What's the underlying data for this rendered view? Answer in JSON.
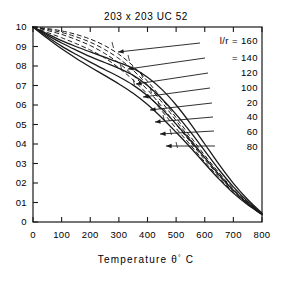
{
  "chart_data": {
    "type": "line",
    "title": "203 x 203  UC 52",
    "xlabel": "Temperature  θ° C",
    "ylabel": "",
    "xlim": [
      0,
      800
    ],
    "ylim": [
      0,
      1.0
    ],
    "grid": false,
    "legend_position": "right-inside",
    "xticks": [
      0,
      100,
      200,
      300,
      400,
      500,
      600,
      700,
      800
    ],
    "xticklabels": [
      "0",
      "100",
      "200",
      "300",
      "400",
      "500",
      "600",
      "700",
      "800"
    ],
    "yticks": [
      0,
      0.1,
      0.2,
      0.3,
      0.4,
      0.5,
      0.6,
      0.7,
      0.8,
      0.9,
      1.0
    ],
    "yticklabels": [
      "0",
      "01",
      "02",
      "03",
      "04",
      "05",
      "06",
      "07",
      "08",
      "09",
      "10"
    ],
    "legend_title": "l/r = 160",
    "legend_entries": [
      {
        "label": "l/r = 160",
        "value": 160,
        "style": "solid"
      },
      {
        "label": "= 140",
        "value": 140,
        "style": "solid"
      },
      {
        "label": "120",
        "value": 120,
        "style": "solid"
      },
      {
        "label": "100",
        "value": 100,
        "style": "solid"
      },
      {
        "label": "20",
        "value": 20,
        "style": "solid"
      },
      {
        "label": "40",
        "value": 40,
        "style": "solid"
      },
      {
        "label": "60",
        "value": 60,
        "style": "solid"
      },
      {
        "label": "80",
        "value": 80,
        "style": "solid"
      }
    ],
    "series": [
      {
        "name": "l/r = 160",
        "style": "solid",
        "x": [
          0,
          50,
          100,
          150,
          200,
          250,
          300,
          350,
          400,
          450,
          500,
          550,
          600,
          650,
          700,
          750,
          800
        ],
        "y": [
          1.0,
          0.965,
          0.93,
          0.9,
          0.872,
          0.845,
          0.818,
          0.788,
          0.742,
          0.68,
          0.6,
          0.505,
          0.4,
          0.295,
          0.198,
          0.115,
          0.045
        ]
      },
      {
        "name": "l/r = 140",
        "style": "solid",
        "x": [
          0,
          50,
          100,
          150,
          200,
          250,
          300,
          350,
          400,
          450,
          500,
          550,
          600,
          650,
          700,
          750,
          800
        ],
        "y": [
          1.0,
          0.958,
          0.918,
          0.882,
          0.848,
          0.818,
          0.788,
          0.752,
          0.7,
          0.632,
          0.552,
          0.462,
          0.365,
          0.268,
          0.18,
          0.105,
          0.042
        ]
      },
      {
        "name": "l/r = 120",
        "style": "solid",
        "x": [
          0,
          50,
          100,
          150,
          200,
          250,
          300,
          350,
          400,
          450,
          500,
          550,
          600,
          650,
          700,
          750,
          800
        ],
        "y": [
          1.0,
          0.95,
          0.902,
          0.86,
          0.82,
          0.782,
          0.745,
          0.702,
          0.648,
          0.58,
          0.502,
          0.418,
          0.33,
          0.242,
          0.162,
          0.095,
          0.04
        ]
      },
      {
        "name": "l/r = 100",
        "style": "solid",
        "x": [
          0,
          50,
          100,
          150,
          200,
          250,
          300,
          350,
          400,
          450,
          500,
          550,
          600,
          650,
          700,
          750,
          800
        ],
        "y": [
          1.0,
          0.942,
          0.888,
          0.84,
          0.795,
          0.752,
          0.708,
          0.66,
          0.602,
          0.535,
          0.46,
          0.382,
          0.3,
          0.22,
          0.148,
          0.088,
          0.038
        ]
      },
      {
        "name": "l/r = 20",
        "style": "dashed",
        "x": [
          0,
          50,
          100,
          150,
          200,
          250,
          300,
          350,
          400,
          450,
          500,
          550,
          600,
          650,
          700,
          750,
          800
        ],
        "y": [
          1.0,
          0.992,
          0.98,
          0.962,
          0.938,
          0.905,
          0.86,
          0.8,
          0.722,
          0.632,
          0.535,
          0.438,
          0.342,
          0.252,
          0.17,
          0.1,
          0.04
        ]
      },
      {
        "name": "l/r = 40",
        "style": "dashed",
        "x": [
          0,
          50,
          100,
          150,
          200,
          250,
          300,
          350,
          400,
          450,
          500,
          550,
          600,
          650,
          700,
          750,
          800
        ],
        "y": [
          1.0,
          0.988,
          0.972,
          0.95,
          0.922,
          0.885,
          0.838,
          0.778,
          0.702,
          0.615,
          0.52,
          0.425,
          0.332,
          0.245,
          0.165,
          0.097,
          0.039
        ]
      },
      {
        "name": "l/r = 60",
        "style": "dashed",
        "x": [
          0,
          50,
          100,
          150,
          200,
          250,
          300,
          350,
          400,
          450,
          500,
          550,
          600,
          650,
          700,
          750,
          800
        ],
        "y": [
          1.0,
          0.982,
          0.962,
          0.936,
          0.905,
          0.865,
          0.815,
          0.752,
          0.678,
          0.592,
          0.5,
          0.41,
          0.32,
          0.236,
          0.158,
          0.093,
          0.038
        ]
      },
      {
        "name": "l/r = 80",
        "style": "dashed",
        "x": [
          0,
          50,
          100,
          150,
          200,
          250,
          300,
          350,
          400,
          450,
          500,
          550,
          600,
          650,
          700,
          750,
          800
        ],
        "y": [
          1.0,
          0.972,
          0.945,
          0.915,
          0.882,
          0.842,
          0.79,
          0.728,
          0.655,
          0.57,
          0.48,
          0.395,
          0.308,
          0.228,
          0.152,
          0.09,
          0.037
        ]
      }
    ]
  }
}
